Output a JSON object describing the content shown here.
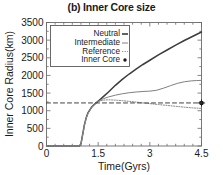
{
  "chart_data": {
    "type": "line",
    "title": "(b) Inner Core size",
    "xlabel": "Time(Gyrs)",
    "ylabel": "Inner Core Radius(km)",
    "xlim": [
      0,
      4.5
    ],
    "ylim": [
      0,
      3500
    ],
    "xticks": [
      0,
      1.5,
      3,
      4.5
    ],
    "xtick_labels": [
      "0",
      "1.5",
      "3",
      "4.5"
    ],
    "yticks": [
      0,
      500,
      1000,
      1500,
      2000,
      2500,
      3000,
      3500
    ],
    "ytick_labels": [
      "0",
      "500",
      "1000",
      "1500",
      "2000",
      "2500",
      "3000",
      "3500"
    ],
    "grid": false,
    "legend_position": "upper left",
    "series": [
      {
        "name": "Neutral",
        "style": "solid",
        "color": "#3c3c3c",
        "x": [
          0.0,
          0.2,
          0.4,
          0.6,
          0.8,
          0.95,
          1.0,
          1.05,
          1.1,
          1.15,
          1.2,
          1.3,
          1.4,
          1.5,
          1.65,
          1.8,
          2.0,
          2.2,
          2.4,
          2.6,
          2.8,
          3.0,
          3.25,
          3.5,
          3.75,
          4.0,
          4.25,
          4.5
        ],
        "y": [
          0,
          0,
          0,
          0,
          0,
          0,
          60,
          330,
          600,
          790,
          930,
          1090,
          1190,
          1270,
          1400,
          1530,
          1720,
          1890,
          2040,
          2180,
          2310,
          2430,
          2580,
          2720,
          2860,
          2990,
          3110,
          3230
        ]
      },
      {
        "name": "Intermediate",
        "style": "thin-solid",
        "color": "#808080",
        "x": [
          0.0,
          0.2,
          0.4,
          0.6,
          0.8,
          0.95,
          1.0,
          1.05,
          1.1,
          1.15,
          1.2,
          1.3,
          1.4,
          1.5,
          1.65,
          1.8,
          2.0,
          2.2,
          2.4,
          2.6,
          2.8,
          3.0,
          3.2,
          3.4,
          3.6,
          3.8,
          4.0,
          4.2,
          4.35,
          4.5
        ],
        "y": [
          0,
          0,
          0,
          0,
          0,
          0,
          55,
          320,
          590,
          780,
          920,
          1080,
          1180,
          1265,
          1340,
          1390,
          1440,
          1480,
          1510,
          1530,
          1545,
          1555,
          1580,
          1640,
          1710,
          1775,
          1820,
          1845,
          1855,
          1860
        ]
      },
      {
        "name": "Reference",
        "style": "dotted",
        "color": "#8a8a8a",
        "x": [
          0.0,
          0.2,
          0.4,
          0.6,
          0.8,
          0.95,
          1.0,
          1.05,
          1.1,
          1.15,
          1.2,
          1.3,
          1.4,
          1.5,
          1.65,
          1.8,
          2.0,
          2.2,
          2.4,
          2.6,
          2.8,
          3.0,
          3.25,
          3.5,
          3.75,
          4.0,
          4.25,
          4.5
        ],
        "y": [
          0,
          0,
          0,
          0,
          0,
          0,
          50,
          310,
          580,
          775,
          915,
          1075,
          1175,
          1260,
          1300,
          1310,
          1300,
          1285,
          1265,
          1245,
          1220,
          1200,
          1175,
          1150,
          1125,
          1100,
          1080,
          1065
        ]
      },
      {
        "name": "Inner Core",
        "style": "marker",
        "color": "#1a1a1a",
        "x": [
          4.5
        ],
        "y": [
          1220
        ]
      },
      {
        "name": "present-day-inner-core-level",
        "style": "dashed",
        "color": "#404040",
        "x": [
          0.0,
          4.5
        ],
        "y": [
          1220,
          1220
        ]
      }
    ],
    "legend_entries": [
      {
        "label": "Neutral",
        "style": "solid"
      },
      {
        "label": "Intermediate",
        "style": "thin-solid"
      },
      {
        "label": "Reference",
        "style": "dotted"
      },
      {
        "label": "Inner Core",
        "style": "marker"
      }
    ]
  }
}
